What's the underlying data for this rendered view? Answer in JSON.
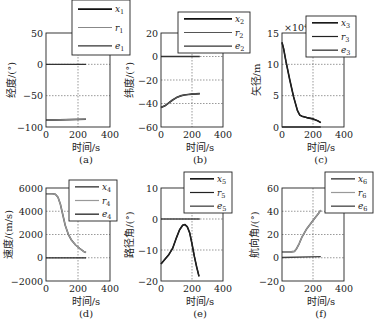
{
  "figure": {
    "xlabel": "时间/s",
    "x_ticks": [
      "0",
      "200",
      "400"
    ]
  },
  "chart_data": [
    {
      "id": "a",
      "type": "line",
      "caption": "(a)",
      "title": "",
      "xlabel": "时间/s",
      "ylabel": "经度/(°)",
      "xlim": [
        0,
        400
      ],
      "ylim": [
        -100,
        50
      ],
      "x_ticks": [
        0,
        200,
        400
      ],
      "y_ticks": [
        50,
        0,
        -50,
        -100
      ],
      "y_tick_labels": [
        "50",
        "0",
        "−50",
        "−100"
      ],
      "grid": true,
      "legend": [
        "x1",
        "r1",
        "e1"
      ],
      "legend_display": [
        [
          "x",
          "1"
        ],
        [
          "r",
          "1"
        ],
        [
          "e",
          "1"
        ]
      ],
      "series": [
        {
          "name": "x1",
          "color": "#111111",
          "x": [
            0,
            250
          ],
          "y": [
            -89,
            -87.5
          ]
        },
        {
          "name": "r1",
          "color": "#888888",
          "x": [
            0,
            250
          ],
          "y": [
            -89,
            -87.5
          ]
        },
        {
          "name": "e1",
          "color": "#333333",
          "x": [
            0,
            250
          ],
          "y": [
            0,
            0
          ]
        }
      ]
    },
    {
      "id": "b",
      "type": "line",
      "caption": "(b)",
      "title": "",
      "xlabel": "时间/s",
      "ylabel": "纬度/(°)",
      "xlim": [
        0,
        400
      ],
      "ylim": [
        -60,
        20
      ],
      "x_ticks": [
        0,
        200,
        400
      ],
      "y_ticks": [
        20,
        0,
        -20,
        -40,
        -60
      ],
      "y_tick_labels": [
        "20",
        "0",
        "−20",
        "−40",
        "−60"
      ],
      "grid": true,
      "legend": [
        "x2",
        "r2",
        "e2"
      ],
      "legend_display": [
        [
          "x",
          "2"
        ],
        [
          "r",
          "2"
        ],
        [
          "e",
          "2"
        ]
      ],
      "series": [
        {
          "name": "x2",
          "color": "#111111",
          "x": [
            0,
            25,
            50,
            75,
            100,
            125,
            150,
            175,
            200,
            225,
            250
          ],
          "y": [
            -43.5,
            -42,
            -39.5,
            -37,
            -35,
            -33.5,
            -32.8,
            -32.3,
            -32,
            -31.8,
            -31.6
          ]
        },
        {
          "name": "r2",
          "color": "#555555",
          "x": [
            0,
            25,
            50,
            75,
            100,
            125,
            150,
            175,
            200,
            225,
            250
          ],
          "y": [
            -43.5,
            -42,
            -39.5,
            -37,
            -35,
            -33.5,
            -32.8,
            -32.3,
            -32,
            -31.8,
            -31.6
          ]
        },
        {
          "name": "e2",
          "color": "#333333",
          "x": [
            0,
            250
          ],
          "y": [
            0,
            0
          ]
        }
      ]
    },
    {
      "id": "c",
      "type": "line",
      "caption": "(c)",
      "title": "",
      "xlabel": "时间/s",
      "ylabel": "矢径/m",
      "multiplier": "×10⁴",
      "xlim": [
        0,
        400
      ],
      "ylim": [
        0,
        15
      ],
      "x_ticks": [
        0,
        200,
        400
      ],
      "y_ticks": [
        15,
        10,
        5,
        0
      ],
      "y_tick_labels": [
        "15",
        "10",
        "5",
        "0"
      ],
      "grid": true,
      "legend": [
        "x3",
        "r3",
        "e3"
      ],
      "legend_display": [
        [
          "x",
          "3"
        ],
        [
          "r",
          "3"
        ],
        [
          "e",
          "3"
        ]
      ],
      "series": [
        {
          "name": "x3",
          "color": "#111111",
          "x": [
            0,
            10,
            25,
            50,
            75,
            100,
            115,
            130,
            160,
            200,
            230,
            250
          ],
          "y": [
            13.5,
            12.5,
            10.5,
            7.5,
            4.8,
            2.6,
            1.9,
            1.7,
            1.5,
            1.3,
            1.0,
            0.7
          ]
        },
        {
          "name": "r3",
          "color": "#222222",
          "x": [
            0,
            10,
            25,
            50,
            75,
            100,
            115,
            130,
            160,
            200,
            230,
            250
          ],
          "y": [
            13.5,
            12.5,
            10.5,
            7.5,
            4.8,
            2.6,
            1.9,
            1.7,
            1.5,
            1.3,
            1.0,
            0.7
          ]
        },
        {
          "name": "e3",
          "color": "#333333",
          "x": [
            0,
            250
          ],
          "y": [
            0,
            0
          ]
        }
      ]
    },
    {
      "id": "d",
      "type": "line",
      "caption": "(d)",
      "title": "",
      "xlabel": "时间/s",
      "ylabel": "速度/(m/s)",
      "xlim": [
        0,
        400
      ],
      "ylim": [
        -2000,
        6000
      ],
      "x_ticks": [
        0,
        200,
        400
      ],
      "y_ticks": [
        6000,
        4000,
        2000,
        0,
        -2000
      ],
      "y_tick_labels": [
        "6000",
        "4000",
        "2000",
        "0",
        "−2000"
      ],
      "grid": true,
      "legend": [
        "x4",
        "r4",
        "e4"
      ],
      "legend_display": [
        [
          "x",
          "4"
        ],
        [
          "r",
          "4"
        ],
        [
          "e",
          "4"
        ]
      ],
      "series": [
        {
          "name": "x4",
          "color": "#555555",
          "x": [
            0,
            40,
            60,
            75,
            90,
            105,
            120,
            140,
            160,
            185,
            210,
            235,
            250
          ],
          "y": [
            5500,
            5500,
            5450,
            5200,
            4600,
            3700,
            2800,
            2000,
            1500,
            1100,
            800,
            550,
            450
          ]
        },
        {
          "name": "r4",
          "color": "#999999",
          "x": [
            0,
            40,
            60,
            75,
            90,
            105,
            120,
            140,
            160,
            185,
            210,
            235,
            250
          ],
          "y": [
            5500,
            5500,
            5450,
            5200,
            4600,
            3700,
            2800,
            2000,
            1500,
            1100,
            800,
            550,
            450
          ]
        },
        {
          "name": "e4",
          "color": "#222222",
          "x": [
            0,
            250
          ],
          "y": [
            0,
            0
          ]
        }
      ]
    },
    {
      "id": "e",
      "type": "line",
      "caption": "(e)",
      "title": "",
      "xlabel": "时间/s",
      "ylabel": "路径角/(°)",
      "xlim": [
        0,
        400
      ],
      "ylim": [
        -20,
        10
      ],
      "x_ticks": [
        0,
        200,
        400
      ],
      "y_ticks": [
        10,
        0,
        -10,
        -20
      ],
      "y_tick_labels": [
        "10",
        "0",
        "−10",
        "−20"
      ],
      "grid": true,
      "legend": [
        "x5",
        "r5",
        "e5"
      ],
      "legend_display": [
        [
          "x",
          "5"
        ],
        [
          "r",
          "5"
        ],
        [
          "e",
          "5"
        ]
      ],
      "series": [
        {
          "name": "x5",
          "color": "#111111",
          "x": [
            0,
            25,
            50,
            75,
            100,
            120,
            140,
            155,
            170,
            185,
            200,
            215,
            230,
            245
          ],
          "y": [
            -14.5,
            -13,
            -11.5,
            -9.5,
            -6,
            -3.5,
            -2,
            -1.8,
            -2.5,
            -4.5,
            -8,
            -12,
            -15.5,
            -18.5
          ]
        },
        {
          "name": "r5",
          "color": "#222222",
          "x": [
            0,
            25,
            50,
            75,
            100,
            120,
            140,
            155,
            170,
            185,
            200,
            215,
            230,
            245
          ],
          "y": [
            -14.5,
            -13,
            -11.5,
            -9.5,
            -6,
            -3.5,
            -2,
            -1.8,
            -2.5,
            -4.5,
            -8,
            -12,
            -15.5,
            -18.5
          ]
        },
        {
          "name": "e5",
          "color": "#444444",
          "x": [
            0,
            250
          ],
          "y": [
            0,
            0
          ]
        }
      ]
    },
    {
      "id": "f",
      "type": "line",
      "caption": "(f)",
      "title": "",
      "xlabel": "时间/s",
      "ylabel": "航向角/(°)",
      "xlim": [
        0,
        400
      ],
      "ylim": [
        -20,
        60
      ],
      "x_ticks": [
        0,
        200,
        400
      ],
      "y_ticks": [
        60,
        40,
        20,
        0,
        -20
      ],
      "y_tick_labels": [
        "60",
        "40",
        "20",
        "0",
        "−20"
      ],
      "grid": true,
      "legend": [
        "x6",
        "r6",
        "e6"
      ],
      "legend_display": [
        [
          "x",
          "6"
        ],
        [
          "r",
          "6"
        ],
        [
          "e",
          "6"
        ]
      ],
      "series": [
        {
          "name": "x6",
          "color": "#555555",
          "x": [
            0,
            60,
            80,
            95,
            110,
            130,
            160,
            200,
            240,
            250
          ],
          "y": [
            5,
            5,
            5.5,
            8,
            12,
            18,
            25,
            32,
            39,
            41
          ]
        },
        {
          "name": "r6",
          "color": "#999999",
          "x": [
            0,
            60,
            80,
            95,
            110,
            130,
            160,
            200,
            240,
            250
          ],
          "y": [
            5,
            5,
            5.5,
            8,
            12,
            18,
            25,
            32,
            39,
            41
          ]
        },
        {
          "name": "e6",
          "color": "#444444",
          "x": [
            0,
            250
          ],
          "y": [
            0.2,
            1
          ]
        }
      ]
    }
  ],
  "layout": {
    "panels": [
      {
        "left": 46,
        "right": 110,
        "top": 33,
        "bottom": 127,
        "leg": {
          "x": 72,
          "y": 0,
          "w": 58,
          "h": 55
        },
        "ylab_x": 12
      },
      {
        "left": 161,
        "right": 223,
        "top": 33,
        "bottom": 127,
        "leg": {
          "x": 178,
          "y": 12,
          "w": 72,
          "h": 41
        },
        "ylab_x": 130
      },
      {
        "left": 282,
        "right": 344,
        "top": 33,
        "bottom": 127,
        "leg": {
          "x": 306,
          "y": 16,
          "w": 50,
          "h": 41
        },
        "ylab_x": 257
      },
      {
        "left": 46,
        "right": 110,
        "top": 188,
        "bottom": 281,
        "leg": {
          "x": 69,
          "y": 180,
          "w": 48,
          "h": 41
        },
        "ylab_x": 9
      },
      {
        "left": 161,
        "right": 223,
        "top": 188,
        "bottom": 281,
        "leg": {
          "x": 184,
          "y": 172,
          "w": 48,
          "h": 41
        },
        "ylab_x": 130
      },
      {
        "left": 282,
        "right": 344,
        "top": 188,
        "bottom": 281,
        "leg": {
          "x": 325,
          "y": 172,
          "w": 48,
          "h": 41
        },
        "ylab_x": 255
      }
    ]
  }
}
